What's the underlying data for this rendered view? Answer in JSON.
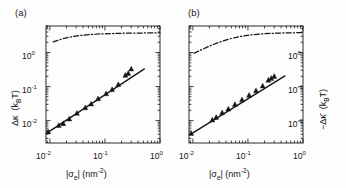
{
  "figure": {
    "background": "#fdfdfd",
    "ink_color": "#141414",
    "panel_count": 2
  },
  "panels": [
    {
      "tag": "(a)",
      "yaxis_side": "left",
      "ylabel_main": "Δκ",
      "ylabel_units": "(k",
      "ylabel_units_sub": "B",
      "ylabel_units_tail": "T)",
      "ylabel_full": "Δκ  (k_BT)",
      "xlabel_full": "|σ_e| (nm^-2)",
      "y_ticks": [
        "10⁰",
        "10⁻¹",
        "10⁻²"
      ],
      "x_ticks": [
        "10⁻²",
        "10⁻¹",
        "10⁰"
      ]
    },
    {
      "tag": "(b)",
      "yaxis_side": "right",
      "ylabel_main": "−Δκ̄",
      "ylabel_units": "(k",
      "ylabel_units_sub": "B",
      "ylabel_units_tail": "T)",
      "ylabel_full": "−Δκ̄  (k_BT)",
      "xlabel_full": "|σ_e| (nm^-2)",
      "y_ticks": [
        "10⁰",
        "10⁻¹",
        "10⁻²"
      ],
      "x_ticks": [
        "10⁻²",
        "10⁻¹",
        "10⁰"
      ]
    }
  ],
  "axis_text": {
    "x_tick_m2": "10",
    "x_tick_m2_exp": "-2",
    "x_tick_m1": "10",
    "x_tick_m1_exp": "-1",
    "x_tick_0": "10",
    "x_tick_0_exp": "0",
    "y_tick_0": "10",
    "y_tick_0_exp": "0",
    "y_tick_m1": "10",
    "y_tick_m1_exp": "-1",
    "y_tick_m2": "10",
    "y_tick_m2_exp": "-2",
    "sigma_open": "|σ",
    "sigma_sub": "e",
    "sigma_close": "| (nm",
    "nm_exp": "-2",
    "nm_close": ")",
    "kappa_a": "Δκ",
    "kappa_b": "−Δκ",
    "kbt_open": "(k",
    "kbt_sub": "B",
    "kbt_close": "T)"
  },
  "chart_data": [
    {
      "type": "scatter",
      "panel": "(a)",
      "title": "",
      "xlabel": "|σ_e| (nm^-2)",
      "ylabel": "Δκ (k_BT)",
      "xscale": "log",
      "yscale": "log",
      "xlim": [
        0.0085,
        1.0
      ],
      "ylim": [
        0.0022,
        6.0
      ],
      "grid": false,
      "legend": "none",
      "series": [
        {
          "name": "data",
          "marker": "filled-triangle",
          "x": [
            0.0093,
            0.0145,
            0.0175,
            0.0225,
            0.031,
            0.044,
            0.056,
            0.075,
            0.105,
            0.135,
            0.175,
            0.235,
            0.265,
            0.3
          ],
          "y": [
            0.0047,
            0.0072,
            0.0082,
            0.0112,
            0.0165,
            0.024,
            0.031,
            0.044,
            0.062,
            0.082,
            0.115,
            0.215,
            0.245,
            0.33
          ]
        },
        {
          "name": "power-law fit",
          "style": "solid-line",
          "slope_loglog": 1.0,
          "x": [
            0.0092,
            0.52
          ],
          "y": [
            0.0045,
            0.33
          ]
        },
        {
          "name": "theory (counterion/PB limit)",
          "style": "dash-dot-line",
          "x": [
            0.0115,
            0.016,
            0.022,
            0.032,
            0.05,
            0.08,
            0.13,
            0.22,
            0.36,
            0.6,
            1.0
          ],
          "y": [
            2.05,
            2.45,
            2.8,
            3.1,
            3.35,
            3.5,
            3.6,
            3.68,
            3.72,
            3.75,
            3.78
          ]
        }
      ]
    },
    {
      "type": "scatter",
      "panel": "(b)",
      "title": "",
      "xlabel": "|σ_e| (nm^-2)",
      "ylabel": "−Δκ̄ (k_BT)",
      "xscale": "log",
      "yscale": "log",
      "xlim": [
        0.0085,
        1.0
      ],
      "ylim": [
        0.0022,
        6.0
      ],
      "grid": false,
      "legend": "none",
      "series": [
        {
          "name": "data",
          "marker": "filled-triangle",
          "x": [
            0.0093,
            0.0225,
            0.0265,
            0.034,
            0.044,
            0.058,
            0.078,
            0.105,
            0.14,
            0.185,
            0.235,
            0.265,
            0.3
          ],
          "y": [
            0.0042,
            0.0105,
            0.0125,
            0.017,
            0.022,
            0.03,
            0.041,
            0.056,
            0.076,
            0.105,
            0.155,
            0.175,
            0.2
          ]
        },
        {
          "name": "power-law fit",
          "style": "solid-line",
          "slope_loglog": 1.0,
          "x": [
            0.0092,
            0.47
          ],
          "y": [
            0.004,
            0.205
          ]
        },
        {
          "name": "theory (counterion/PB limit)",
          "style": "dash-dot-line",
          "x": [
            0.0105,
            0.015,
            0.021,
            0.03,
            0.046,
            0.072,
            0.115,
            0.19,
            0.32,
            0.55,
            1.0
          ],
          "y": [
            0.95,
            1.25,
            1.6,
            2.0,
            2.5,
            2.95,
            3.3,
            3.55,
            3.7,
            3.78,
            3.82
          ]
        }
      ]
    }
  ]
}
